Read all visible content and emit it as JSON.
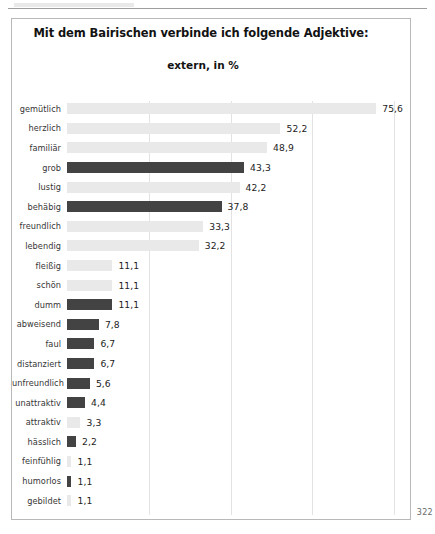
{
  "page": {
    "page_number": "322"
  },
  "chart_data": {
    "type": "bar",
    "orientation": "horizontal",
    "title": "Mit dem Bairischen verbinde ich folgende Adjektive:",
    "subtitle": "extern, in %",
    "xlabel": "",
    "ylabel": "",
    "xlim": [
      0,
      80
    ],
    "grid": true,
    "gridlines": [
      20,
      40,
      60,
      80
    ],
    "legend": "none",
    "value_decimal_separator": ",",
    "colors": {
      "positive_bar": "#e9e9e9",
      "negative_bar": "#434343",
      "gridline": "#e2e2e2",
      "frame": "#b9b9b9",
      "text": "#1c1c1c"
    },
    "categories": [
      "gemütlich",
      "herzlich",
      "familiär",
      "grob",
      "lustig",
      "behäbig",
      "freundlich",
      "lebendig",
      "fleißig",
      "schön",
      "dumm",
      "abweisend",
      "faul",
      "distanziert",
      "unfreundlich",
      "unattraktiv",
      "attraktiv",
      "hässlich",
      "feinfühlig",
      "humorlos",
      "gebildet"
    ],
    "values": [
      75.6,
      52.2,
      48.9,
      43.3,
      42.2,
      37.8,
      33.3,
      32.2,
      11.1,
      11.1,
      11.1,
      7.8,
      6.7,
      6.7,
      5.6,
      4.4,
      3.3,
      2.2,
      1.1,
      1.1,
      1.1
    ],
    "value_labels": [
      "75,6",
      "52,2",
      "48,9",
      "43,3",
      "42,2",
      "37,8",
      "33,3",
      "32,2",
      "11,1",
      "11,1",
      "11,1",
      "7,8",
      "6,7",
      "6,7",
      "5,6",
      "4,4",
      "3,3",
      "2,2",
      "1,1",
      "1,1",
      "1,1"
    ],
    "bar_styles": [
      "light",
      "light",
      "light",
      "dark",
      "light",
      "dark",
      "light",
      "light",
      "light",
      "light",
      "dark",
      "dark",
      "dark",
      "dark",
      "dark",
      "dark",
      "light",
      "dark",
      "light",
      "dark",
      "light"
    ]
  }
}
